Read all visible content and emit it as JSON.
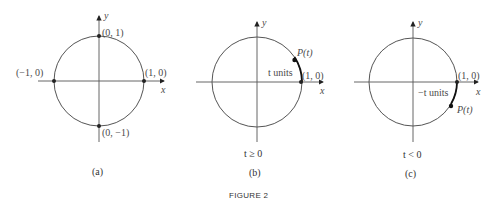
{
  "figure": {
    "title": "FIGURE 2",
    "panels": [
      {
        "caption": "(a)",
        "condition": "",
        "axes": {
          "x": "x",
          "y": "y"
        },
        "points": [
          {
            "label": "(0, 1)"
          },
          {
            "label": "(1, 0)"
          },
          {
            "label": "(−1, 0)"
          },
          {
            "label": "(0, −1)"
          }
        ]
      },
      {
        "caption": "(b)",
        "condition": "t ≥ 0",
        "axes": {
          "x": "x",
          "y": "y"
        },
        "points": [
          {
            "label": "(1, 0)"
          },
          {
            "label": "P(t)"
          }
        ],
        "arc_label": "t units"
      },
      {
        "caption": "(c)",
        "condition": "t < 0",
        "axes": {
          "x": "x",
          "y": "y"
        },
        "points": [
          {
            "label": "(1, 0)"
          },
          {
            "label": "P(t)"
          }
        ],
        "arc_label": "−t units"
      }
    ]
  },
  "colors": {
    "stroke": "#555555",
    "arc_highlight": "#111111",
    "text": "#4a4a4a"
  }
}
